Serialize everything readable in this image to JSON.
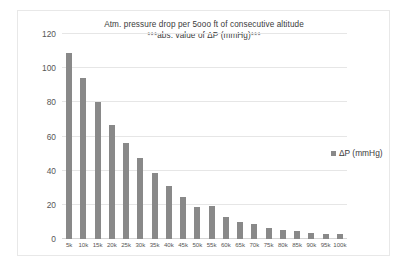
{
  "chart_data": {
    "type": "bar",
    "title": "Atm. pressure drop per 5ooo ft of consecutive altitude",
    "subtitle": "***abs. value of ΔP (mmHg)***",
    "xlabel": "",
    "ylabel": "",
    "ylim": [
      0,
      120
    ],
    "yticks": [
      0,
      20,
      40,
      60,
      80,
      100,
      120
    ],
    "grid": true,
    "legend_position": "right",
    "series": [
      {
        "name": "ΔP (mmHg)",
        "color": "#898989",
        "values": [
          109,
          94,
          80,
          67,
          56,
          47.5,
          38.5,
          31,
          24.5,
          18.5,
          19.5,
          13,
          10,
          8.5,
          6.5,
          5.5,
          4.5,
          3.5,
          3,
          3
        ]
      }
    ],
    "categories": [
      "5k",
      "10k",
      "15k",
      "20k",
      "25k",
      "30k",
      "35k",
      "40k",
      "45k",
      "50k",
      "55k",
      "60k",
      "65k",
      "70k",
      "75k",
      "80k",
      "85k",
      "90k",
      "95k",
      "100k"
    ]
  },
  "legend": {
    "entries": [
      {
        "label": "ΔP (mmHg)",
        "marker": "square-marker",
        "color": "#898989"
      }
    ]
  },
  "colors": {
    "bar": "#898989",
    "gridline": "#e6e6e6",
    "axis": "#d4d4d4",
    "text": "#575757",
    "title_text": "#3b3b3b",
    "card_border": "#e8e8e8",
    "background": "#ffffff"
  }
}
